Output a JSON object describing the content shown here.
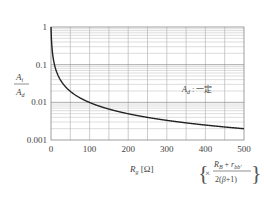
{
  "chart_data": {
    "type": "line",
    "title": "",
    "xlabel": "R_g [Ω]",
    "ylabel": "A_i / A_d",
    "x_scale": "linear",
    "y_scale": "log",
    "xlim": [
      0,
      500
    ],
    "ylim": [
      0.001,
      1
    ],
    "x_ticks": [
      "0",
      "100",
      "200",
      "300",
      "400",
      "500"
    ],
    "y_ticks": [
      "1",
      "0.1",
      "0.01",
      "0.001"
    ],
    "grid": true,
    "legend": null,
    "x_unit_note": "× (R_B + r_bb') / 2(β+1)",
    "annotation": "A_d : 一定",
    "series": [
      {
        "name": "A_i / A_d",
        "x": [
          0,
          5,
          10,
          20,
          30,
          50,
          75,
          100,
          150,
          200,
          250,
          300,
          350,
          400,
          450,
          500
        ],
        "y": [
          1,
          0.167,
          0.091,
          0.048,
          0.032,
          0.0196,
          0.0132,
          0.0099,
          0.0066,
          0.005,
          0.004,
          0.0033,
          0.0028,
          0.0025,
          0.0022,
          0.002
        ]
      }
    ]
  }
}
